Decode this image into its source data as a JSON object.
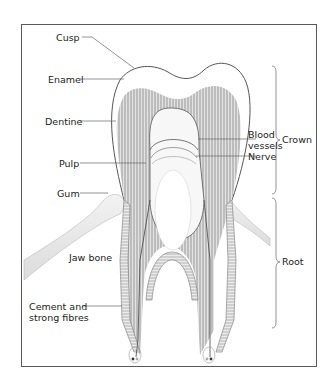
{
  "diagram": {
    "labels_left": [
      {
        "id": "cusp",
        "text": "Cusp"
      },
      {
        "id": "enamel",
        "text": "Enamel"
      },
      {
        "id": "dentine",
        "text": "Dentine"
      },
      {
        "id": "pulp",
        "text": "Pulp"
      },
      {
        "id": "gum",
        "text": "Gum"
      },
      {
        "id": "jaw_bone",
        "text": "Jaw bone"
      },
      {
        "id": "cement_line1",
        "text": "Cement and"
      },
      {
        "id": "cement_line2",
        "text": "strong fibres"
      }
    ],
    "labels_right": [
      {
        "id": "blood_line1",
        "text": "Blood"
      },
      {
        "id": "blood_line2",
        "text": "vessels"
      },
      {
        "id": "nerve",
        "text": "Nerve"
      }
    ],
    "brackets": [
      {
        "id": "crown",
        "text": "Crown"
      },
      {
        "id": "root",
        "text": "Root"
      }
    ],
    "colors": {
      "frame": "#5a5a5a",
      "outline": "#555555",
      "dentine": "#bdbdbd",
      "dentine_stripes": "#e6e6e6",
      "gum": "#ececec",
      "leader": "#666666"
    }
  }
}
